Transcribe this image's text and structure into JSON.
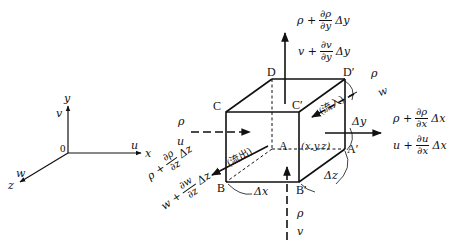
{
  "axes": {
    "origin": "0",
    "x_axis": "x",
    "y_axis": "y",
    "z_axis": "z",
    "u_label": "u",
    "v_label": "v",
    "w_label": "w"
  },
  "cube_vertices": {
    "A": "A",
    "A_prime": "A′",
    "B": "B",
    "B_prime": "B′",
    "C": "C",
    "C_prime": "C′",
    "D": "D",
    "D_prime": "D′",
    "point": "(x,y,z)"
  },
  "dimensions": {
    "dx": "Δx",
    "dy": "Δy",
    "dz": "Δz"
  },
  "flow_labels": {
    "inflow": "(流入)",
    "outflow": "(流出)"
  },
  "inflow_left": {
    "rho": "ρ",
    "vel": "u"
  },
  "inflow_bottom": {
    "rho": "ρ",
    "vel": "v"
  },
  "inflow_back": {
    "rho": "ρ",
    "vel": "w"
  },
  "outflow_top": {
    "rho_prefix": "ρ +",
    "rho_num": "∂ρ",
    "rho_den": "∂y",
    "rho_suffix": "Δy",
    "vel_prefix": "v +",
    "vel_num": "∂v",
    "vel_den": "∂y",
    "vel_suffix": "Δy"
  },
  "outflow_right": {
    "rho_prefix": "ρ +",
    "rho_num": "∂ρ",
    "rho_den": "∂x",
    "rho_suffix": "Δx",
    "vel_prefix": "u +",
    "vel_num": "∂u",
    "vel_den": "∂x",
    "vel_suffix": "Δx"
  },
  "outflow_front": {
    "rho_prefix": "ρ +",
    "rho_num": "∂ρ",
    "rho_den": "∂z",
    "rho_suffix": "Δz",
    "vel_prefix": "w +",
    "vel_num": "∂w",
    "vel_den": "∂z",
    "vel_suffix": "Δz"
  },
  "colors": {
    "line": "#111111",
    "background": "#ffffff"
  }
}
